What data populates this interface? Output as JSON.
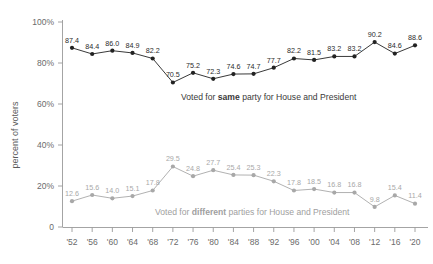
{
  "chart_data": {
    "type": "line",
    "title": "",
    "subtitle": "",
    "xlabel": "",
    "ylabel": "percent of voters",
    "ylim": [
      0,
      100
    ],
    "xlim": [
      "'52",
      "'20"
    ],
    "grid": false,
    "legend_position": "inline-annotation",
    "categories": [
      "'52",
      "'56",
      "'60",
      "'64",
      "'68",
      "'72",
      "'76",
      "'80",
      "'84",
      "'88",
      "'92",
      "'96",
      "'00",
      "'04",
      "'08",
      "'12",
      "'16",
      "'20"
    ],
    "ytick_labels": [
      "0",
      "20%",
      "40%",
      "60%",
      "80%",
      "100%"
    ],
    "ytick_values": [
      0,
      20,
      40,
      60,
      80,
      100
    ],
    "series": [
      {
        "name": "Voted for same party for House and President",
        "color": "#222222",
        "label_color": "#2b2b2b",
        "values": [
          87.4,
          84.4,
          86.0,
          84.9,
          82.2,
          70.5,
          75.2,
          72.3,
          74.6,
          74.7,
          77.7,
          82.2,
          81.5,
          83.2,
          83.2,
          90.2,
          84.6,
          88.6
        ],
        "data_labels": [
          "87.4",
          "84.4",
          "86.0",
          "84.9",
          "82.2",
          "70.5",
          "75.2",
          "72.3",
          "74.6",
          "74.7",
          "77.7",
          "82.2",
          "81.5",
          "83.2",
          "83.2",
          "90.2",
          "84.6",
          "88.6"
        ]
      },
      {
        "name": "Voted for different parties for House and President",
        "color": "#a8a8a8",
        "label_color": "#a8a8a8",
        "values": [
          12.6,
          15.6,
          14.0,
          15.1,
          17.8,
          29.5,
          24.8,
          27.7,
          25.4,
          25.3,
          22.3,
          17.8,
          18.5,
          16.8,
          16.8,
          9.8,
          15.4,
          11.4
        ],
        "data_labels": [
          "12.6",
          "15.6",
          "14.0",
          "15.1",
          "17.8",
          "29.5",
          "24.8",
          "27.7",
          "25.4",
          "25.3",
          "22.3",
          "17.8",
          "18.5",
          "16.8",
          "16.8",
          "9.8",
          "15.4",
          "11.4"
        ]
      }
    ],
    "annotations": [
      {
        "id": "same-party-annotation",
        "prefix": "Voted for ",
        "strong": "same",
        "suffix": " party for House and President",
        "color": "#3a3a3a"
      },
      {
        "id": "different-parties-annotation",
        "prefix": "Voted for ",
        "strong": "different",
        "suffix": " parties for House and President",
        "color": "#a0a0a0"
      }
    ]
  }
}
